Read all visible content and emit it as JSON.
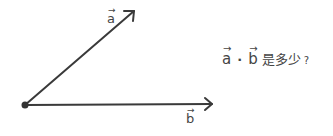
{
  "diagram": {
    "origin": {
      "x": 25,
      "y": 105
    },
    "vectors": [
      {
        "name": "a",
        "label": "a",
        "arrow_glyph": "→",
        "tip": {
          "x": 135,
          "y": 10
        },
        "label_pos": {
          "x": 106,
          "y": 12
        }
      },
      {
        "name": "b",
        "label": "b",
        "arrow_glyph": "→",
        "tip": {
          "x": 213,
          "y": 104
        },
        "label_pos": {
          "x": 185,
          "y": 113
        }
      }
    ],
    "stroke_color": "#3a3a3a"
  },
  "question": {
    "vec_a": "a",
    "vec_b": "b",
    "arrow_glyph": "→",
    "operator": "·",
    "text": "是多少",
    "question_mark": "?"
  }
}
